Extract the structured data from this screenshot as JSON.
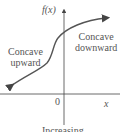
{
  "diagram": {
    "y_axis_label": "f(x)",
    "x_axis_label": "x",
    "origin_label": "0",
    "left_region": {
      "line1": "Concave",
      "line2": "upward"
    },
    "right_region": {
      "line1": "Concave",
      "line2": "downward"
    },
    "caption": "Increasing",
    "colors": {
      "curve": "#555555",
      "axis": "#444444",
      "text": "#555555"
    }
  }
}
